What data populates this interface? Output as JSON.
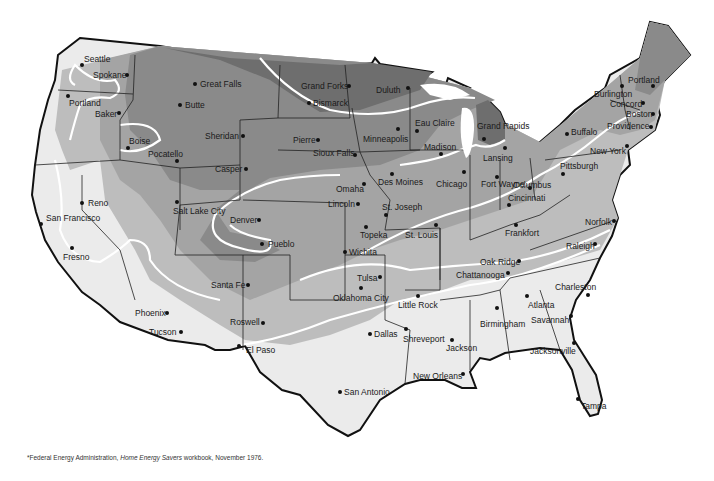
{
  "map": {
    "title": "Heating zones of the contiguous United States",
    "zone_colors": {
      "zone_1_warmest": "#ebebeb",
      "zone_2": "#bdbdbd",
      "zone_3": "#a4a4a4",
      "zone_4": "#8a8a8a",
      "zone_5_coldest": "#6e6e6e",
      "zone_boundary": "#ffffff",
      "state_border": "#222222"
    },
    "cities": [
      {
        "name": "Seattle",
        "x": 82,
        "y": 65,
        "lx": 84,
        "ly": 55
      },
      {
        "name": "Spokane",
        "x": 127,
        "y": 75,
        "lx": 93,
        "ly": 71
      },
      {
        "name": "Portland",
        "x": 68,
        "y": 96,
        "lx": 69,
        "ly": 99
      },
      {
        "name": "Baker",
        "x": 119,
        "y": 113,
        "lx": 95,
        "ly": 110
      },
      {
        "name": "Boise",
        "x": 128,
        "y": 148,
        "lx": 129,
        "ly": 137
      },
      {
        "name": "Pocatello",
        "x": 177,
        "y": 161,
        "lx": 148,
        "ly": 150
      },
      {
        "name": "Great Falls",
        "x": 195,
        "y": 84,
        "lx": 200,
        "ly": 80
      },
      {
        "name": "Butte",
        "x": 180,
        "y": 105,
        "lx": 185,
        "ly": 101
      },
      {
        "name": "Sheridan",
        "x": 243,
        "y": 136,
        "lx": 205,
        "ly": 132
      },
      {
        "name": "Casper",
        "x": 246,
        "y": 169,
        "lx": 215,
        "ly": 165
      },
      {
        "name": "Grand Forks",
        "x": 349,
        "y": 86,
        "lx": 301,
        "ly": 82
      },
      {
        "name": "Bismarck",
        "x": 309,
        "y": 103,
        "lx": 313,
        "ly": 99
      },
      {
        "name": "Duluth",
        "x": 408,
        "y": 88,
        "lx": 376,
        "ly": 86
      },
      {
        "name": "Pierre",
        "x": 318,
        "y": 140,
        "lx": 293,
        "ly": 136
      },
      {
        "name": "Sioux Falls",
        "x": 355,
        "y": 155,
        "lx": 313,
        "ly": 149
      },
      {
        "name": "Minneapolis",
        "x": 398,
        "y": 129,
        "lx": 363,
        "ly": 135
      },
      {
        "name": "Eau Claire",
        "x": 417,
        "y": 131,
        "lx": 415,
        "ly": 119
      },
      {
        "name": "Madison",
        "x": 441,
        "y": 154,
        "lx": 424,
        "ly": 143
      },
      {
        "name": "Grand Rapids",
        "x": 484,
        "y": 139,
        "lx": 477,
        "ly": 122
      },
      {
        "name": "Lansing",
        "x": 505,
        "y": 148,
        "lx": 483,
        "ly": 154
      },
      {
        "name": "Burlington",
        "x": 622,
        "y": 86,
        "lx": 594,
        "ly": 90
      },
      {
        "name": "Portland",
        "x": 653,
        "y": 86,
        "lx": 628,
        "ly": 76
      },
      {
        "name": "Concord",
        "x": 643,
        "y": 103,
        "lx": 610,
        "ly": 100
      },
      {
        "name": "Boston",
        "x": 653,
        "y": 114,
        "lx": 626,
        "ly": 110
      },
      {
        "name": "Providence",
        "x": 651,
        "y": 127,
        "lx": 607,
        "ly": 122
      },
      {
        "name": "Buffalo",
        "x": 567,
        "y": 134,
        "lx": 571,
        "ly": 128
      },
      {
        "name": "New York",
        "x": 627,
        "y": 146,
        "lx": 590,
        "ly": 147
      },
      {
        "name": "Pittsburgh",
        "x": 563,
        "y": 174,
        "lx": 560,
        "ly": 162
      },
      {
        "name": "Seattle",
        "x": 0,
        "y": 0,
        "lx": 0,
        "ly": 0,
        "hidden": true
      }
    ],
    "cities_central": [
      {
        "name": "Reno",
        "x": 82,
        "y": 203,
        "lx": 88,
        "ly": 199
      },
      {
        "name": "San Francisco",
        "x": 41,
        "y": 224,
        "lx": 46,
        "ly": 214
      },
      {
        "name": "Fresno",
        "x": 72,
        "y": 248,
        "lx": 63,
        "ly": 253
      },
      {
        "name": "Salt Lake City",
        "x": 177,
        "y": 202,
        "lx": 173,
        "ly": 207
      },
      {
        "name": "Denver",
        "x": 259,
        "y": 220,
        "lx": 230,
        "ly": 216
      },
      {
        "name": "Pueblo",
        "x": 262,
        "y": 244,
        "lx": 268,
        "ly": 240
      },
      {
        "name": "Omaha",
        "x": 364,
        "y": 184,
        "lx": 336,
        "ly": 185
      },
      {
        "name": "Lincoln",
        "x": 358,
        "y": 204,
        "lx": 328,
        "ly": 200
      },
      {
        "name": "Des Moines",
        "x": 392,
        "y": 174,
        "lx": 378,
        "ly": 178
      },
      {
        "name": "Chicago",
        "x": 464,
        "y": 172,
        "lx": 436,
        "ly": 180
      },
      {
        "name": "Fort Wayne",
        "x": 497,
        "y": 177,
        "lx": 481,
        "ly": 180
      },
      {
        "name": "Columbus",
        "x": 530,
        "y": 188,
        "lx": 513,
        "ly": 181
      },
      {
        "name": "Cincinnati",
        "x": 509,
        "y": 205,
        "lx": 508,
        "ly": 194
      },
      {
        "name": "St. Joseph",
        "x": 386,
        "y": 215,
        "lx": 382,
        "ly": 203
      },
      {
        "name": "Topeka",
        "x": 366,
        "y": 227,
        "lx": 360,
        "ly": 231
      },
      {
        "name": "St. Louis",
        "x": 436,
        "y": 225,
        "lx": 405,
        "ly": 231
      },
      {
        "name": "Wichita",
        "x": 345,
        "y": 252,
        "lx": 349,
        "ly": 248
      },
      {
        "name": "Frankfort",
        "x": 516,
        "y": 225,
        "lx": 505,
        "ly": 229
      },
      {
        "name": "Norfolk",
        "x": 614,
        "y": 221,
        "lx": 585,
        "ly": 218
      },
      {
        "name": "Raleigh",
        "x": 595,
        "y": 244,
        "lx": 566,
        "ly": 242
      },
      {
        "name": "Oak Ridge",
        "x": 519,
        "y": 261,
        "lx": 480,
        "ly": 258
      },
      {
        "name": "Chattanooga",
        "x": 508,
        "y": 273,
        "lx": 456,
        "ly": 271
      },
      {
        "name": "Tulsa",
        "x": 380,
        "y": 277,
        "lx": 357,
        "ly": 274
      },
      {
        "name": "Oklahoma City",
        "x": 361,
        "y": 288,
        "lx": 333,
        "ly": 294
      },
      {
        "name": "Santa Fe",
        "x": 248,
        "y": 285,
        "lx": 211,
        "ly": 281
      },
      {
        "name": "Little Rock",
        "x": 418,
        "y": 296,
        "lx": 398,
        "ly": 301
      },
      {
        "name": "Phoenix",
        "x": 167,
        "y": 313,
        "lx": 135,
        "ly": 309
      },
      {
        "name": "Roswell",
        "x": 263,
        "y": 323,
        "lx": 230,
        "ly": 318
      }
    ],
    "cities_south": [
      {
        "name": "Tucson",
        "x": 181,
        "y": 332,
        "lx": 149,
        "ly": 328
      },
      {
        "name": "El Paso",
        "x": 239,
        "y": 346,
        "lx": 246,
        "ly": 346
      },
      {
        "name": "Dallas",
        "x": 370,
        "y": 334,
        "lx": 374,
        "ly": 330
      },
      {
        "name": "Shreveport",
        "x": 406,
        "y": 329,
        "lx": 403,
        "ly": 335
      },
      {
        "name": "Jackson",
        "x": 452,
        "y": 340,
        "lx": 446,
        "ly": 344
      },
      {
        "name": "Birmingham",
        "x": 497,
        "y": 308,
        "lx": 480,
        "ly": 320
      },
      {
        "name": "Atlanta",
        "x": 527,
        "y": 296,
        "lx": 528,
        "ly": 301
      },
      {
        "name": "Savannah",
        "x": 571,
        "y": 316,
        "lx": 531,
        "ly": 316
      },
      {
        "name": "Charleston",
        "x": 588,
        "y": 295,
        "lx": 555,
        "ly": 283
      },
      {
        "name": "Jacksonville",
        "x": 574,
        "y": 343,
        "lx": 530,
        "ly": 347
      },
      {
        "name": "New Orleans",
        "x": 463,
        "y": 374,
        "lx": 413,
        "ly": 372
      },
      {
        "name": "San Antonio",
        "x": 340,
        "y": 392,
        "lx": 344,
        "ly": 388
      },
      {
        "name": "Tampa",
        "x": 578,
        "y": 399,
        "lx": 581,
        "ly": 402
      }
    ]
  },
  "footnote": {
    "prefix": "*Federal Energy Administration, ",
    "title": "Home Energy Savers",
    "suffix": " workbook, November 1976."
  }
}
